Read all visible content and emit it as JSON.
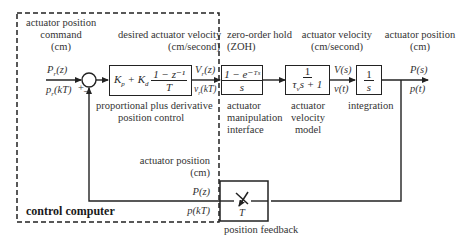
{
  "control_computer": {
    "label": "control computer"
  },
  "input": {
    "title": [
      "actuator position",
      "command",
      "(cm)"
    ],
    "signal_z": "Pr(z)",
    "signal_t": "pr(kT)",
    "sum_plus": "+",
    "sum_minus": "–"
  },
  "pd_controller": {
    "title": [
      "desired actuator velocity",
      "(cm/second)"
    ],
    "block_prefix": "Kp + Kd",
    "block_num": "1 − z⁻¹",
    "block_den": "T",
    "caption": [
      "proportional plus derivative",
      "position control"
    ],
    "out_z": "Vr(z)",
    "out_t": "vr(kT)"
  },
  "zoh": {
    "title": [
      "zero-order hold",
      "(ZOH)"
    ],
    "block_num": "1 − e⁻ᵀˢ",
    "block_den": "s",
    "caption": [
      "actuator",
      "manipulation",
      "interface"
    ]
  },
  "velocity_model": {
    "title": [
      "actuator velocity",
      "(cm/second)"
    ],
    "block_num": "1",
    "block_den": "τvs + 1",
    "caption": [
      "actuator",
      "velocity",
      "model"
    ],
    "out_s": "V(s)",
    "out_t": "v(t)"
  },
  "integrator": {
    "block_num": "1",
    "block_den": "s",
    "caption": "integration"
  },
  "output": {
    "title": [
      "actuator position",
      "(cm)"
    ],
    "out_s": "P(s)",
    "out_t": "p(t)"
  },
  "feedback": {
    "title": [
      "actuator position",
      "(cm)"
    ],
    "signal_z": "P(z)",
    "signal_t": "p(kT)",
    "sampler_label": "T",
    "caption": "position feedback"
  }
}
